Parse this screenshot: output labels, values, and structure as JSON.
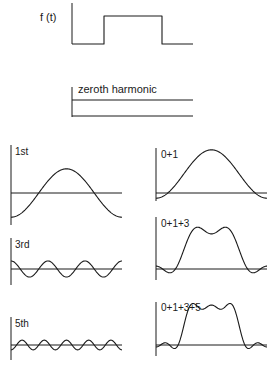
{
  "figure": {
    "stroke_color": "#1a1a1a",
    "background": "#ffffff"
  },
  "panels": [
    {
      "id": "ft",
      "label": "f (t)",
      "kind": "pulse",
      "axis": {
        "x": 72,
        "y1": 3,
        "y2": 44
      },
      "baseline": {
        "y": 44,
        "x1": 72,
        "x2": 193
      },
      "pulse": {
        "x1": 104,
        "x2": 162,
        "top": 16
      },
      "label_pos": {
        "x": 40,
        "y": 21
      }
    },
    {
      "id": "zeroth",
      "label": "zeroth harmonic",
      "kind": "dc",
      "axis": {
        "x": 72,
        "y1": 87,
        "y2": 117
      },
      "baseline": {
        "y": 116,
        "x1": 72,
        "x2": 193
      },
      "level": 100,
      "label_pos": {
        "x": 78,
        "y": 93
      }
    },
    {
      "id": "h1",
      "label": "1st",
      "kind": "harmonic",
      "harmonics": [
        1
      ],
      "include_dc": false,
      "axis": {
        "x": 11,
        "y1": 145,
        "y2": 225
      },
      "baseline": {
        "y": 193,
        "x1": 11,
        "x2": 122
      },
      "scale": 20,
      "label_pos": {
        "x": 15,
        "y": 155
      }
    },
    {
      "id": "h3",
      "label": "3rd",
      "kind": "harmonic",
      "harmonics": [
        3
      ],
      "include_dc": false,
      "axis": {
        "x": 11,
        "y1": 238,
        "y2": 285
      },
      "baseline": {
        "y": 269,
        "x1": 11,
        "x2": 122
      },
      "scale": 20,
      "label_pos": {
        "x": 15,
        "y": 248
      }
    },
    {
      "id": "h5",
      "label": "5th",
      "kind": "harmonic",
      "harmonics": [
        5
      ],
      "include_dc": false,
      "axis": {
        "x": 11,
        "y1": 317,
        "y2": 360
      },
      "baseline": {
        "y": 345,
        "x1": 11,
        "x2": 122
      },
      "scale": 20,
      "label_pos": {
        "x": 15,
        "y": 327
      }
    },
    {
      "id": "s01",
      "label": "0+1",
      "kind": "sum",
      "harmonics": [
        1
      ],
      "include_dc": true,
      "axis": {
        "x": 156,
        "y1": 148,
        "y2": 201
      },
      "baseline": {
        "y": 193,
        "x1": 156,
        "x2": 267
      },
      "scale": 20,
      "label_pos": {
        "x": 161,
        "y": 158
      }
    },
    {
      "id": "s013",
      "label": "0+1+3",
      "kind": "sum",
      "harmonics": [
        1,
        3
      ],
      "include_dc": true,
      "axis": {
        "x": 156,
        "y1": 217,
        "y2": 280
      },
      "baseline": {
        "y": 269,
        "x1": 156,
        "x2": 267
      },
      "scale": 20,
      "label_pos": {
        "x": 161,
        "y": 227
      }
    },
    {
      "id": "s0135",
      "label": "0+1+3+5",
      "kind": "sum",
      "harmonics": [
        1,
        3,
        5
      ],
      "include_dc": true,
      "axis": {
        "x": 156,
        "y1": 302,
        "y2": 356
      },
      "baseline": {
        "y": 345,
        "x1": 156,
        "x2": 267
      },
      "scale": 20,
      "label_pos": {
        "x": 161,
        "y": 311
      }
    }
  ]
}
